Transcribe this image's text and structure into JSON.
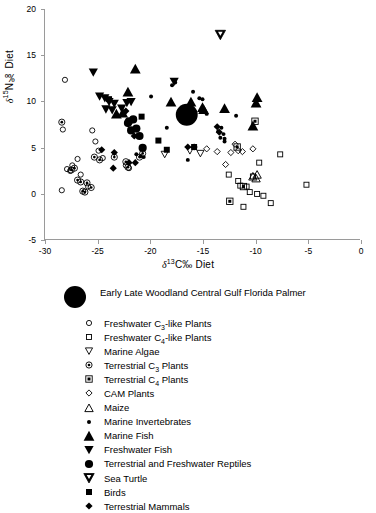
{
  "chart_data": {
    "type": "scatter",
    "title": "",
    "xlabel": "δ13C‰ Diet",
    "ylabel": "δ15N‰ Diet",
    "xlim": [
      -30,
      0
    ],
    "ylim": [
      -5,
      20
    ],
    "xticks": [
      -30,
      -25,
      -20,
      -15,
      -10,
      -5,
      0
    ],
    "yticks": [
      -5,
      0,
      5,
      10,
      15,
      20
    ],
    "grid": false,
    "legend_position": "below-plot",
    "series": [
      {
        "name": "Early Late Woodland Central Gulf Florida Palmer",
        "marker": "big-filled-circle",
        "points": [
          [
            -16.5,
            8.5
          ]
        ]
      },
      {
        "name": "Freshwater C3-like Plants",
        "marker": "open-circle",
        "points": [
          [
            -28.1,
            12.3
          ],
          [
            -28.4,
            0.3
          ],
          [
            -28.3,
            6.9
          ],
          [
            -27.9,
            2.6
          ],
          [
            -27.6,
            2.4
          ],
          [
            -27.4,
            3.0
          ],
          [
            -26.9,
            3.7
          ],
          [
            -26.6,
            2.0
          ],
          [
            -25.9,
            0.7
          ],
          [
            -25.5,
            6.8
          ],
          [
            -25.2,
            5.6
          ],
          [
            -24.9,
            4.6
          ],
          [
            -24.5,
            3.8
          ],
          [
            -22.3,
            3.0
          ],
          [
            -22.0,
            2.7
          ]
        ]
      },
      {
        "name": "Freshwater C4-like Plants",
        "marker": "open-square",
        "points": [
          [
            -12.5,
            2.0
          ],
          [
            -11.6,
            1.3
          ],
          [
            -11.4,
            0.8
          ],
          [
            -10.8,
            0.7
          ],
          [
            -10.5,
            0.1
          ],
          [
            -10.2,
            1.8
          ],
          [
            -9.8,
            -0.1
          ],
          [
            -9.6,
            3.3
          ],
          [
            -9.2,
            -0.3
          ],
          [
            -8.5,
            -1.1
          ],
          [
            -7.6,
            4.2
          ],
          [
            -5.1,
            0.9
          ],
          [
            -11.1,
            -1.5
          ]
        ]
      },
      {
        "name": "Marine Algae",
        "marker": "open-down-triangle",
        "points": [
          [
            -18.6,
            4.2
          ],
          [
            -16.2,
            4.6
          ],
          [
            -15.2,
            4.3
          ]
        ]
      },
      {
        "name": "Terrestrial C3 Plants",
        "marker": "circled-dot",
        "points": [
          [
            -28.4,
            7.7
          ],
          [
            -27.5,
            2.5
          ],
          [
            -27.2,
            2.7
          ],
          [
            -26.9,
            1.4
          ],
          [
            -26.6,
            1.2
          ],
          [
            -26.4,
            0.2
          ],
          [
            -26.2,
            0.1
          ],
          [
            -26.0,
            1.1
          ],
          [
            -25.6,
            0.6
          ],
          [
            -25.3,
            3.9
          ],
          [
            -24.8,
            3.6
          ],
          [
            -23.4,
            3.9
          ],
          [
            -22.3,
            3.4
          ],
          [
            -22.1,
            2.8
          ],
          [
            -21.0,
            3.9
          ],
          [
            -20.7,
            4.3
          ]
        ]
      },
      {
        "name": "Terrestrial C4 Plants",
        "marker": "squared-dot",
        "points": [
          [
            -11.7,
            5.0
          ],
          [
            -12.4,
            -0.9
          ],
          [
            -11.1,
            0.7
          ],
          [
            -10.0,
            7.8
          ]
        ]
      },
      {
        "name": "CAM Plants",
        "marker": "small-open-diamond",
        "points": [
          [
            -14.6,
            4.8
          ],
          [
            -13.6,
            4.5
          ],
          [
            -12.8,
            3.1
          ],
          [
            -12.3,
            4.4
          ],
          [
            -11.9,
            5.3
          ],
          [
            -11.6,
            4.6
          ],
          [
            -11.2,
            4.5
          ],
          [
            -10.2,
            4.8
          ]
        ]
      },
      {
        "name": "Maize",
        "marker": "open-up-triangle",
        "points": [
          [
            -10.2,
            1.8
          ],
          [
            -9.8,
            2.0
          ],
          [
            -9.9,
            1.6
          ]
        ]
      },
      {
        "name": "Marine Invertebrates",
        "marker": "small-dot",
        "points": [
          [
            -19.9,
            10.5
          ],
          [
            -18.4,
            7.1
          ],
          [
            -17.6,
            12.0
          ],
          [
            -17.9,
            11.7
          ],
          [
            -15.9,
            11.0
          ],
          [
            -15.3,
            10.3
          ],
          [
            -15.0,
            10.2
          ],
          [
            -14.6,
            8.6
          ],
          [
            -13.5,
            6.7
          ],
          [
            -13.2,
            7.1
          ],
          [
            -13.0,
            6.4
          ],
          [
            -13.3,
            6.0
          ],
          [
            -12.9,
            5.6
          ],
          [
            -11.8,
            8.4
          ],
          [
            -21.3,
            4.2
          ],
          [
            -20.9,
            4.0
          ],
          [
            -20.6,
            3.9
          ],
          [
            -12.9,
            5.9
          ],
          [
            -16.4,
            3.6
          ]
        ]
      },
      {
        "name": "Marine Fish",
        "marker": "filled-up-triangle",
        "points": [
          [
            -21.4,
            13.5
          ],
          [
            -22.1,
            11.0
          ],
          [
            -18.0,
            9.9
          ],
          [
            -16.1,
            9.9
          ],
          [
            -15.0,
            9.3
          ],
          [
            -12.9,
            9.2
          ],
          [
            -9.8,
            10.4
          ],
          [
            -9.9,
            9.8
          ],
          [
            -10.2,
            7.3
          ],
          [
            -22.6,
            8.7
          ],
          [
            -23.2,
            8.6
          ],
          [
            -14.9,
            9.1
          ]
        ]
      },
      {
        "name": "Freshwater Fish",
        "marker": "filled-down-triangle",
        "points": [
          [
            -25.4,
            13.1
          ],
          [
            -24.8,
            10.5
          ],
          [
            -24.3,
            10.3
          ],
          [
            -23.9,
            9.9
          ],
          [
            -23.4,
            9.7
          ],
          [
            -22.7,
            9.2
          ],
          [
            -22.2,
            9.8
          ],
          [
            -21.8,
            9.9
          ],
          [
            -17.7,
            12.1
          ],
          [
            -24.2,
            9.1
          ],
          [
            -23.6,
            9.0
          ]
        ]
      },
      {
        "name": "Terrestrial and Freshwater Reptiles",
        "marker": "filled-circle",
        "points": [
          [
            -22.1,
            7.6
          ],
          [
            -21.6,
            8.0
          ],
          [
            -21.3,
            7.0
          ],
          [
            -21.0,
            6.2
          ],
          [
            -20.7,
            4.9
          ],
          [
            -22.0,
            7.8
          ],
          [
            -21.8,
            6.8
          ]
        ]
      },
      {
        "name": "Sea Turtle",
        "marker": "filled-down-triangle-outline",
        "points": [
          [
            -13.3,
            17.2
          ]
        ]
      },
      {
        "name": "Birds",
        "marker": "filled-square",
        "points": [
          [
            -23.9,
            10.2
          ],
          [
            -19.2,
            5.7
          ],
          [
            -18.4,
            4.7
          ],
          [
            -20.8,
            8.3
          ],
          [
            -15.8,
            5.0
          ]
        ]
      },
      {
        "name": "Terrestrial Mammals",
        "marker": "filled-diamond",
        "points": [
          [
            -24.6,
            4.7
          ],
          [
            -23.4,
            4.4
          ],
          [
            -23.5,
            2.7
          ],
          [
            -22.0,
            3.3
          ],
          [
            -21.4,
            3.3
          ],
          [
            -22.3,
            8.9
          ],
          [
            -21.5,
            6.2
          ],
          [
            -13.6,
            7.2
          ],
          [
            -13.4,
            6.6
          ],
          [
            -15.8,
            5.0
          ],
          [
            -16.4,
            5.0
          ]
        ]
      }
    ]
  },
  "axes": {
    "y_title_prefix": "δ",
    "y_title_sup": "15",
    "y_title_rest": "N‰ Diet",
    "x_title_prefix": "δ",
    "x_title_sup": "13",
    "x_title_rest": "C‰ Diet"
  },
  "legend": {
    "main": {
      "label": "Early Late Woodland Central Gulf Florida Palmer",
      "marker": "big-filled-circle"
    },
    "items": [
      {
        "label_pre": "Freshwater C",
        "sub": "3",
        "label_post": "-like Plants",
        "marker": "open-circle"
      },
      {
        "label_pre": "Freshwater C",
        "sub": "4",
        "label_post": "-like Plants",
        "marker": "open-square"
      },
      {
        "label_pre": "Marine Algae",
        "sub": "",
        "label_post": "",
        "marker": "open-down-triangle"
      },
      {
        "label_pre": "Terrestrial C",
        "sub": "3",
        "label_post": " Plants",
        "marker": "circled-dot"
      },
      {
        "label_pre": "Terrestrial C",
        "sub": "4",
        "label_post": " Plants",
        "marker": "squared-dot"
      },
      {
        "label_pre": "CAM Plants",
        "sub": "",
        "label_post": "",
        "marker": "small-open-diamond"
      },
      {
        "label_pre": "Maize",
        "sub": "",
        "label_post": "",
        "marker": "open-up-triangle"
      },
      {
        "label_pre": "Marine Invertebrates",
        "sub": "",
        "label_post": "",
        "marker": "small-dot"
      },
      {
        "label_pre": "Marine Fish",
        "sub": "",
        "label_post": "",
        "marker": "filled-up-triangle"
      },
      {
        "label_pre": "Freshwater Fish",
        "sub": "",
        "label_post": "",
        "marker": "filled-down-triangle"
      },
      {
        "label_pre": "Terrestrial and Freshwater Reptiles",
        "sub": "",
        "label_post": "",
        "marker": "filled-circle"
      },
      {
        "label_pre": "Sea Turtle",
        "sub": "",
        "label_post": "",
        "marker": "filled-down-triangle-outline"
      },
      {
        "label_pre": "Birds",
        "sub": "",
        "label_post": "",
        "marker": "filled-square"
      },
      {
        "label_pre": "Terrestrial Mammals",
        "sub": "",
        "label_post": "",
        "marker": "filled-diamond"
      }
    ]
  },
  "colors": {
    "marker": "#000000",
    "axis": "#9a9a9a",
    "text": "#000000",
    "background": "#ffffff"
  }
}
